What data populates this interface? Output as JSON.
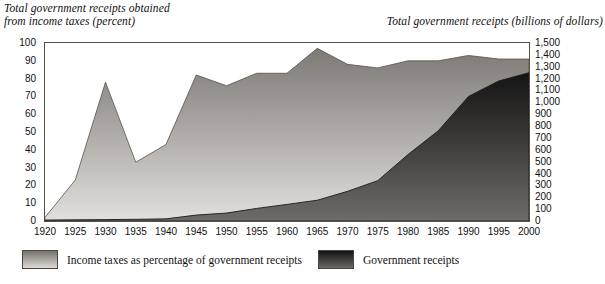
{
  "chart_data": {
    "type": "area",
    "title": "",
    "x": [
      1920,
      1925,
      1930,
      1935,
      1940,
      1945,
      1950,
      1955,
      1960,
      1965,
      1970,
      1975,
      1980,
      1985,
      1990,
      1995,
      2000
    ],
    "xlabel": "",
    "xlim": [
      1920,
      2000
    ],
    "xtick_labels": [
      "1920",
      "1925",
      "1930",
      "1935",
      "1940",
      "1945",
      "1950",
      "1955",
      "1960",
      "1965",
      "1970",
      "1975",
      "1980",
      "1985",
      "1990",
      "1995",
      "2000"
    ],
    "grid": false,
    "legend_position": "bottom",
    "axes": [
      {
        "side": "left",
        "title": "Total government receipts obtained\nfrom income taxes (percent)",
        "ylim": [
          0,
          100
        ],
        "ytick_values": [
          0,
          10,
          20,
          30,
          40,
          50,
          60,
          70,
          80,
          90,
          100
        ],
        "ytick_labels": [
          "0",
          "10",
          "20",
          "30",
          "40",
          "50",
          "60",
          "70",
          "80",
          "90",
          "100"
        ]
      },
      {
        "side": "right",
        "title": "Total government receipts (billions of dollars)",
        "ylim": [
          0,
          1500
        ],
        "ytick_values": [
          0,
          100,
          200,
          300,
          400,
          500,
          600,
          700,
          800,
          900,
          1000,
          1100,
          1200,
          1300,
          1400,
          1500
        ],
        "ytick_labels": [
          "0",
          "100",
          "200",
          "300",
          "400",
          "500",
          "600",
          "700",
          "800",
          "900",
          "1,000",
          "1,100",
          "1,200",
          "1,300",
          "1,400",
          "1,500"
        ]
      }
    ],
    "series": [
      {
        "name": "Income taxes as percentage of government receipts",
        "axis": "left",
        "unit": "percent",
        "fill": "light-gradient",
        "values": [
          2,
          23,
          78,
          33,
          43,
          82,
          76,
          83,
          83,
          97,
          88,
          86,
          90,
          90,
          93,
          91,
          91
        ]
      },
      {
        "name": "Government receipts",
        "axis": "right",
        "unit": "billions of dollars",
        "fill": "dark-gradient",
        "values": [
          8,
          10,
          12,
          14,
          18,
          50,
          67,
          106,
          140,
          175,
          250,
          340,
          560,
          760,
          1050,
          1180,
          1250
        ]
      }
    ]
  },
  "legend": {
    "items": [
      {
        "label": "Income taxes as percentage of government receipts",
        "swatch": "light-gradient"
      },
      {
        "label": "Government receipts",
        "swatch": "dark-gradient"
      }
    ]
  }
}
